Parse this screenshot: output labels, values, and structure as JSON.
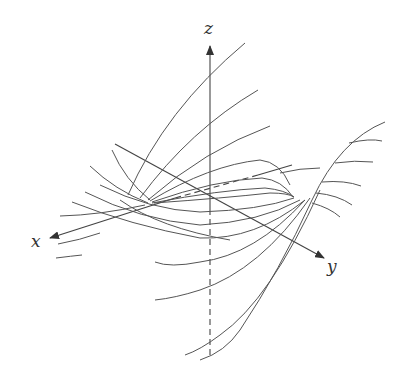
{
  "figure": {
    "colors": {
      "stroke": "#555555",
      "axis": "#444444",
      "background": "#ffffff"
    }
  },
  "axes": {
    "x": {
      "label": "x"
    },
    "y": {
      "label": "y"
    },
    "z": {
      "label": "z"
    }
  }
}
